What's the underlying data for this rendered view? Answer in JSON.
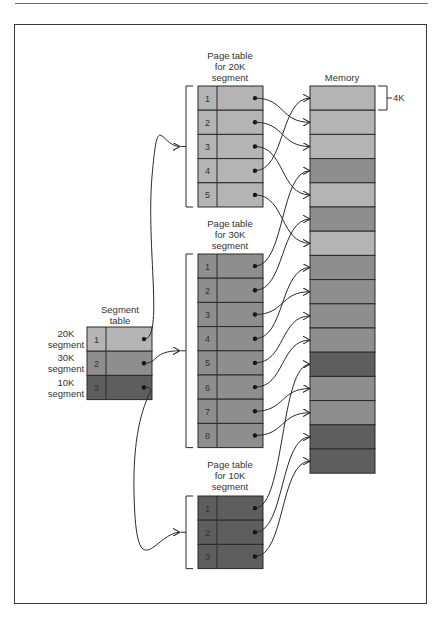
{
  "figure": {
    "colors": {
      "seg20k": "#b4b4b4",
      "seg30k": "#8e8e8e",
      "seg10k": "#5e5e5e",
      "line": "#2a2a2a"
    },
    "segment_table": {
      "title_line1": "Segment",
      "title_line2": "table",
      "rows": [
        {
          "index": "1",
          "label_line1": "20K",
          "label_line2": "segment",
          "kind": "seg20k"
        },
        {
          "index": "2",
          "label_line1": "30K",
          "label_line2": "segment",
          "kind": "seg30k"
        },
        {
          "index": "3",
          "label_line1": "10K",
          "label_line2": "segment",
          "kind": "seg10k"
        }
      ]
    },
    "page_tables": [
      {
        "title_line1": "Page table",
        "title_line2": "for 20K",
        "title_line3": "segment",
        "kind": "seg20k",
        "rows": [
          "1",
          "2",
          "3",
          "4",
          "5"
        ],
        "targets": [
          2,
          3,
          5,
          1,
          7
        ]
      },
      {
        "title_line1": "Page table",
        "title_line2": "for 30K",
        "title_line3": "segment",
        "kind": "seg30k",
        "rows": [
          "1",
          "2",
          "3",
          "4",
          "5",
          "6",
          "7",
          "8"
        ],
        "targets": [
          4,
          6,
          9,
          8,
          10,
          11,
          13,
          14
        ]
      },
      {
        "title_line1": "Page table",
        "title_line2": "for 10K",
        "title_line3": "segment",
        "kind": "seg10k",
        "rows": [
          "1",
          "2",
          "3"
        ],
        "targets": [
          12,
          15,
          16
        ]
      }
    ],
    "memory": {
      "title": "Memory",
      "block_size_label": "4K",
      "blocks": [
        "seg20k",
        "seg20k",
        "seg20k",
        "seg30k",
        "seg20k",
        "seg30k",
        "seg20k",
        "seg30k",
        "seg30k",
        "seg30k",
        "seg30k",
        "seg10k",
        "seg30k",
        "seg30k",
        "seg10k",
        "seg10k"
      ]
    }
  }
}
